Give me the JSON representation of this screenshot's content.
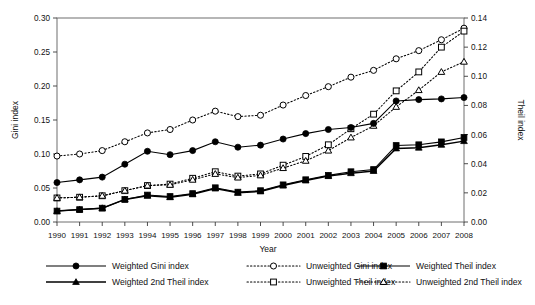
{
  "chart_data": {
    "type": "line",
    "title": "",
    "xlabel": "Year",
    "ylabel": "Gini index",
    "y2label": "Theil index",
    "grid": false,
    "legend_position": "bottom",
    "x": [
      1990,
      1991,
      1992,
      1993,
      1994,
      1995,
      1996,
      1997,
      1998,
      1999,
      2000,
      2001,
      2002,
      2003,
      2004,
      2005,
      2006,
      2007,
      2008
    ],
    "xlim": [
      1990,
      2008
    ],
    "ylim": [
      0.0,
      0.3
    ],
    "y2lim": [
      0.0,
      0.14
    ],
    "ytick_labels": [
      "0.00",
      "0.05",
      "0.10",
      "0.15",
      "0.20",
      "0.25",
      "0.30"
    ],
    "ytick_values": [
      0.0,
      0.05,
      0.1,
      0.15,
      0.2,
      0.25,
      0.3
    ],
    "y2tick_labels": [
      "0.00",
      "0.02",
      "0.04",
      "0.06",
      "0.08",
      "0.10",
      "0.12",
      "0.14"
    ],
    "y2tick_values": [
      0.0,
      0.02,
      0.04,
      0.06,
      0.08,
      0.1,
      0.12,
      0.14
    ],
    "xtick_labels": [
      "1990",
      "1991",
      "1992",
      "1993",
      "1994",
      "1995",
      "1996",
      "1997",
      "1998",
      "1999",
      "2000",
      "2001",
      "2002",
      "2003",
      "2004",
      "2005",
      "2006",
      "2007",
      "2008"
    ],
    "series": [
      {
        "name": "Weighted Gini index",
        "axis": "left",
        "line": "solid",
        "marker": "circle-filled",
        "values": [
          0.058,
          0.062,
          0.066,
          0.085,
          0.104,
          0.099,
          0.105,
          0.118,
          0.11,
          0.113,
          0.122,
          0.13,
          0.136,
          0.139,
          0.145,
          0.178,
          0.18,
          0.181,
          0.183
        ]
      },
      {
        "name": "Unweighted Gini index",
        "axis": "left",
        "line": "dotted",
        "marker": "circle-open",
        "values": [
          0.097,
          0.1,
          0.105,
          0.118,
          0.131,
          0.136,
          0.15,
          0.163,
          0.155,
          0.157,
          0.172,
          0.186,
          0.199,
          0.213,
          0.223,
          0.24,
          0.252,
          0.268,
          0.285
        ]
      },
      {
        "name": "Weighted Theil index",
        "axis": "right",
        "line": "solid",
        "marker": "square-filled",
        "values": [
          0.0075,
          0.0085,
          0.0095,
          0.0155,
          0.0185,
          0.0175,
          0.0195,
          0.0235,
          0.0205,
          0.0215,
          0.0255,
          0.029,
          0.032,
          0.0345,
          0.036,
          0.0525,
          0.053,
          0.055,
          0.058
        ]
      },
      {
        "name": "Unweighted Theil index",
        "axis": "right",
        "line": "dotted",
        "marker": "square-open",
        "values": [
          0.0165,
          0.017,
          0.018,
          0.0215,
          0.025,
          0.026,
          0.03,
          0.0345,
          0.0315,
          0.033,
          0.039,
          0.045,
          0.053,
          0.064,
          0.074,
          0.09,
          0.103,
          0.12,
          0.131
        ]
      },
      {
        "name": "Weighted 2nd Theil index",
        "axis": "right",
        "line": "solid",
        "marker": "triangle-filled",
        "values": [
          0.0075,
          0.0085,
          0.0095,
          0.0155,
          0.018,
          0.017,
          0.019,
          0.023,
          0.02,
          0.021,
          0.025,
          0.0285,
          0.0315,
          0.0335,
          0.035,
          0.0505,
          0.051,
          0.053,
          0.0555
        ]
      },
      {
        "name": "Unweighted 2nd Theil index",
        "axis": "right",
        "line": "dotted",
        "marker": "triangle-open",
        "values": [
          0.0165,
          0.017,
          0.018,
          0.0215,
          0.025,
          0.0255,
          0.029,
          0.033,
          0.0305,
          0.032,
          0.037,
          0.042,
          0.049,
          0.058,
          0.066,
          0.079,
          0.0905,
          0.103,
          0.11
        ]
      }
    ]
  },
  "legend": {
    "entries": [
      {
        "label": "Weighted Gini index"
      },
      {
        "label": "Unweighted Gini index"
      },
      {
        "label": "Weighted Theil index"
      },
      {
        "label": "Weighted 2nd Theil index"
      },
      {
        "label": "Unweighted Theil index"
      },
      {
        "label": "Unweighted 2nd Theil index"
      }
    ]
  }
}
